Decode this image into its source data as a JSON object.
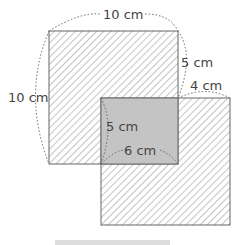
{
  "labels": {
    "top_side": "10 cm",
    "left_side": "10 cm",
    "right_upper": "5 cm",
    "right_offset": "4 cm",
    "overlap_height": "5 cm",
    "overlap_width": "6 cm"
  },
  "colors": {
    "hatch": "#8a8a8a",
    "overlap_fill": "#c4c4c4",
    "outline": "#666666",
    "text": "#444444"
  }
}
